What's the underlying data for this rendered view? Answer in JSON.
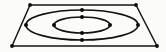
{
  "figure": {
    "width": 166,
    "height": 52,
    "background_color": "#fbfbfa",
    "line_color": "#151515",
    "marker_color": "#0a0a0a"
  },
  "frame": {
    "name": "perspective-quadrilateral",
    "shape": "trapezoid",
    "stroke_width": 1.5,
    "corners": [
      {
        "label": "top-left",
        "x": 30,
        "y": 5
      },
      {
        "label": "top-right",
        "x": 136,
        "y": 5
      },
      {
        "label": "bottom-right",
        "x": 157,
        "y": 46
      },
      {
        "label": "bottom-left",
        "x": 12,
        "y": 46
      }
    ],
    "points_path": "30,5 136,5 157,46 12,46",
    "corner_markers": [
      {
        "label": "corner-marker-top-left",
        "x": 30,
        "y": 5,
        "r": 1.9
      },
      {
        "label": "corner-marker-top-right",
        "x": 136,
        "y": 5,
        "r": 1.9
      },
      {
        "label": "corner-marker-bottom-right",
        "x": 157,
        "y": 46,
        "r": 1.9
      },
      {
        "label": "corner-marker-bottom-left",
        "x": 12,
        "y": 46,
        "r": 1.9
      }
    ]
  },
  "contours": [
    {
      "name": "outer-contour-ellipse",
      "cx": 82,
      "cy": 25,
      "rx": 56,
      "ry": 15,
      "stroke_width": 1.6,
      "markers": [
        {
          "label": "outer-left-node",
          "x": 26,
          "y": 25,
          "r": 2.0
        },
        {
          "label": "outer-right-node",
          "x": 138,
          "y": 25,
          "r": 2.0
        },
        {
          "label": "outer-top-node",
          "x": 82,
          "y": 10,
          "r": 2.0
        },
        {
          "label": "outer-bottom-node",
          "x": 82,
          "y": 40,
          "r": 2.0
        }
      ]
    },
    {
      "name": "inner-contour-ellipse",
      "cx": 82,
      "cy": 25,
      "rx": 28,
      "ry": 8,
      "stroke_width": 1.7,
      "markers": [
        {
          "label": "inner-left-node",
          "x": 54,
          "y": 25,
          "r": 2.0
        },
        {
          "label": "inner-right-node",
          "x": 110,
          "y": 25,
          "r": 2.0
        },
        {
          "label": "inner-top-node",
          "x": 82,
          "y": 17,
          "r": 2.0
        },
        {
          "label": "inner-bottom-node",
          "x": 82,
          "y": 33,
          "r": 2.0
        }
      ]
    }
  ],
  "labels": {
    "visible_text": []
  }
}
